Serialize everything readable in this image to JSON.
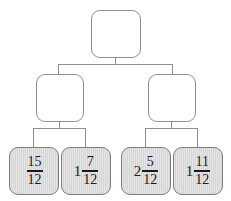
{
  "diagram": {
    "type": "binary-tree",
    "title": "",
    "levels": 3,
    "colors": {
      "leaf_fill": "#d5d5d5",
      "node_fill": "#ffffff",
      "border": "#8f8f8f",
      "leaf_border": "#7d7d7d",
      "text": "#1a1a1a",
      "background": "#ffffff"
    },
    "root": {
      "id": "root",
      "label": "",
      "filled": false
    },
    "middle": [
      {
        "id": "middle-left",
        "label": "",
        "filled": false
      },
      {
        "id": "middle-right",
        "label": "",
        "filled": false
      }
    ],
    "leaves": [
      {
        "id": "leaf-1",
        "filled": true,
        "whole": "",
        "numerator": "15",
        "denominator": "12",
        "value": "15/12"
      },
      {
        "id": "leaf-2",
        "filled": true,
        "whole": "1",
        "numerator": "7",
        "denominator": "12",
        "value": "1 7/12"
      },
      {
        "id": "leaf-3",
        "filled": true,
        "whole": "2",
        "numerator": "5",
        "denominator": "12",
        "value": "2 5/12"
      },
      {
        "id": "leaf-4",
        "filled": true,
        "whole": "1",
        "numerator": "11",
        "denominator": "12",
        "value": "1 11/12"
      }
    ]
  }
}
